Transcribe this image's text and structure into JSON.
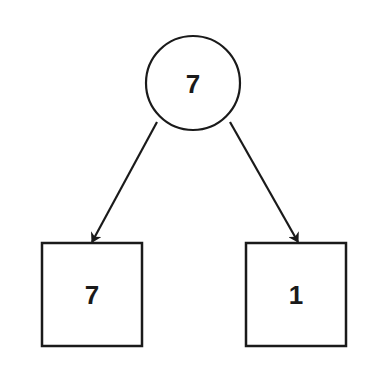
{
  "diagram": {
    "type": "tree",
    "stroke_color": "#1a1a1a",
    "background": "#ffffff",
    "root": {
      "shape": "circle",
      "label": "7"
    },
    "children": [
      {
        "shape": "square",
        "label": "7"
      },
      {
        "shape": "square",
        "label": "1"
      }
    ],
    "edges": [
      {
        "from": "root",
        "to": "children.0",
        "directed": true
      },
      {
        "from": "root",
        "to": "children.1",
        "directed": true
      }
    ]
  }
}
